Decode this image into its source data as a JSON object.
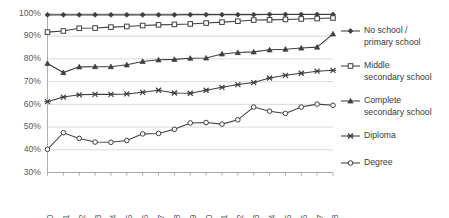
{
  "chart_data": {
    "type": "line",
    "title": "",
    "xlabel": "",
    "ylabel": "",
    "grid": true,
    "legend_position": "right",
    "ylim": [
      30,
      100
    ],
    "ytick_labels": [
      "100%",
      "90%",
      "80%",
      "70%",
      "60%",
      "50%",
      "40%",
      "30%"
    ],
    "ytick_values": [
      100,
      90,
      80,
      70,
      60,
      50,
      40,
      30
    ],
    "categories": [
      "2000",
      "2001",
      "2002",
      "2003",
      "2004",
      "2005",
      "2006",
      "2007",
      "2008",
      "2009",
      "2010",
      "2011",
      "2012",
      "2013",
      "2014",
      "2015",
      "2016",
      "2017",
      "2018"
    ],
    "series": [
      {
        "name": "No school / primary school",
        "marker": "diamond",
        "marker_style": "filled",
        "values": [
          99.4,
          99.4,
          99.4,
          99.4,
          99.4,
          99.4,
          99.4,
          99.4,
          99.4,
          99.5,
          99.5,
          99.5,
          99.5,
          99.5,
          99.6,
          99.6,
          99.6,
          99.6,
          99.6
        ]
      },
      {
        "name": "Middle secondary school",
        "marker": "square",
        "marker_style": "open",
        "values": [
          91.8,
          92.3,
          93.5,
          93.6,
          94.0,
          94.3,
          94.7,
          95.0,
          95.2,
          95.4,
          95.8,
          96.2,
          96.6,
          97.1,
          97.2,
          97.4,
          97.6,
          97.8,
          98.0
        ]
      },
      {
        "name": "Complete secondary school",
        "marker": "triangle",
        "marker_style": "filled",
        "values": [
          78.0,
          74.0,
          76.5,
          76.6,
          76.6,
          77.4,
          78.9,
          79.6,
          79.8,
          80.3,
          80.4,
          82.2,
          82.8,
          83.1,
          84.0,
          84.3,
          84.8,
          85.2,
          91.0
        ]
      },
      {
        "name": "Diploma",
        "marker": "x",
        "marker_style": "x",
        "values": [
          61.2,
          63.2,
          64.2,
          64.4,
          64.4,
          64.6,
          65.3,
          66.2,
          65.0,
          64.9,
          66.2,
          67.5,
          68.7,
          69.6,
          71.6,
          72.8,
          73.7,
          74.6,
          75.0
        ]
      },
      {
        "name": "Degree",
        "marker": "circle",
        "marker_style": "open",
        "values": [
          40.2,
          47.5,
          45.0,
          43.4,
          43.3,
          44.1,
          47.0,
          47.2,
          49.0,
          51.8,
          52.0,
          51.3,
          53.2,
          58.8,
          57.0,
          56.0,
          58.8,
          60.1,
          59.6
        ]
      }
    ]
  },
  "legend": {
    "items": [
      {
        "label_line1": "No school /",
        "label_line2": "primary school",
        "marker": "diamond"
      },
      {
        "label_line1": "Middle",
        "label_line2": "secondary school",
        "marker": "square"
      },
      {
        "label_line1": "Complete",
        "label_line2": "secondary school",
        "marker": "triangle"
      },
      {
        "label_line1": "Diploma",
        "label_line2": "",
        "marker": "x"
      },
      {
        "label_line1": "Degree",
        "label_line2": "",
        "marker": "circle"
      }
    ]
  }
}
